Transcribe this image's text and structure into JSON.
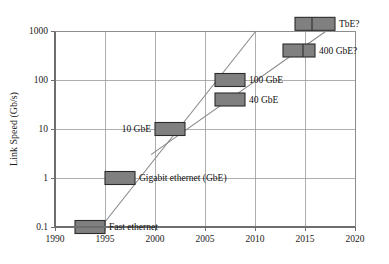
{
  "chart_data": {
    "type": "bar",
    "title": "",
    "subtitle": "",
    "xlabel": "",
    "ylabel": "Link Speed (Gb/s)",
    "xlim": [
      1990,
      2020
    ],
    "ylim": [
      0.1,
      1000
    ],
    "yscale": "log",
    "xscale": "linear",
    "grid": true,
    "legend": "none",
    "x_ticks": [
      "1990",
      "1995",
      "2000",
      "2005",
      "2010",
      "2015",
      "2020"
    ],
    "x_tick_values": [
      1990,
      1995,
      2000,
      2005,
      2010,
      2015,
      2020
    ],
    "y_ticks": [
      "0.1",
      "1",
      "10",
      "100",
      "1000"
    ],
    "y_tick_values": [
      0.1,
      1,
      10,
      100,
      1000
    ],
    "bars": [
      {
        "label": "Fast ethernet",
        "x_start": 1992.0,
        "x_end": 1995.0,
        "value": 0.1,
        "label_side": "right",
        "segments": 1
      },
      {
        "label": "Gigabit ethernet (GbE)",
        "x_start": 1995.0,
        "x_end": 1998.0,
        "value": 1,
        "label_side": "right",
        "segments": 1
      },
      {
        "label": "10 GbE",
        "x_start": 2000.0,
        "x_end": 2003.0,
        "value": 10,
        "label_side": "left",
        "segments": 1
      },
      {
        "label": "40 GbE",
        "x_start": 2006.0,
        "x_end": 2009.0,
        "value": 40,
        "label_side": "right",
        "segments": 1
      },
      {
        "label": "100 GbE",
        "x_start": 2006.0,
        "x_end": 2009.0,
        "value": 100,
        "label_side": "right",
        "segments": 1
      },
      {
        "label": "400 GbE?",
        "x_start": 2012.8,
        "x_end": 2016.0,
        "value": 400,
        "label_side": "right",
        "segments": 2,
        "segment_split": 2014.8
      },
      {
        "label": "TbE?",
        "x_start": 2014.0,
        "x_end": 2018.0,
        "value": 1400,
        "label_side": "right",
        "segments": 2,
        "segment_split": 2015.7
      }
    ],
    "trend_lines": [
      {
        "name": "steep-growth-trend",
        "points": [
          [
            1994.6,
            0.1
          ],
          [
            2012.2,
            3500
          ]
        ]
      },
      {
        "name": "shallow-growth-trend",
        "points": [
          [
            1999.6,
            3.0
          ],
          [
            2020.0,
            2600
          ]
        ]
      }
    ],
    "colors": {
      "bar_fill": "#808080",
      "bar_stroke": "#2b2b2b",
      "grid": "#9a9a9a",
      "axis": "#6e6e6e",
      "trend": "#8a8a8a",
      "background": "#ffffff",
      "text": "#1a1a1a"
    }
  }
}
